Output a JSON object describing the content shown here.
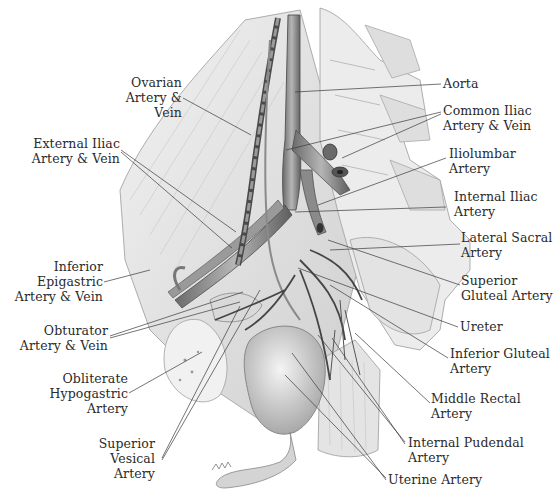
{
  "diagram": {
    "colors": {
      "ink": "#2a2a2a",
      "leader": "#3a3a3a",
      "tissue_light": "#e6e6e6",
      "tissue_mid": "#bdbdbd",
      "vessel_dark": "#555555"
    },
    "labels_left": [
      {
        "id": "ovarian",
        "lines": [
          "Ovarian",
          "Artery &",
          "Vein"
        ]
      },
      {
        "id": "external-iliac",
        "lines": [
          "External Iliac",
          "Artery & Vein"
        ]
      },
      {
        "id": "inferior-epigastric",
        "lines": [
          "Inferior",
          "Epigastric",
          "Artery & Vein"
        ]
      },
      {
        "id": "obturator",
        "lines": [
          "Obturator",
          "Artery & Vein"
        ]
      },
      {
        "id": "obliterate-hypogastric",
        "lines": [
          "Obliterate",
          "Hypogastric",
          "Artery"
        ]
      },
      {
        "id": "superior-vesical",
        "lines": [
          "Superior",
          "Vesical",
          "Artery"
        ]
      }
    ],
    "labels_right": [
      {
        "id": "aorta",
        "lines": [
          "Aorta"
        ]
      },
      {
        "id": "common-iliac",
        "lines": [
          "Common Iliac",
          "Artery & Vein"
        ]
      },
      {
        "id": "iliolumbar",
        "lines": [
          "Iliolumbar",
          "Artery"
        ]
      },
      {
        "id": "internal-iliac",
        "lines": [
          "Internal Iliac",
          "Artery"
        ]
      },
      {
        "id": "lateral-sacral",
        "lines": [
          "Lateral Sacral",
          "Artery"
        ]
      },
      {
        "id": "superior-gluteal",
        "lines": [
          "Superior",
          "Gluteal Artery"
        ]
      },
      {
        "id": "ureter",
        "lines": [
          "Ureter"
        ]
      },
      {
        "id": "inferior-gluteal",
        "lines": [
          "Inferior Gluteal",
          "Artery"
        ]
      },
      {
        "id": "middle-rectal",
        "lines": [
          "Middle Rectal",
          "Artery"
        ]
      },
      {
        "id": "internal-pudendal",
        "lines": [
          "Internal Pudendal",
          "Artery"
        ]
      },
      {
        "id": "uterine",
        "lines": [
          "Uterine Artery"
        ]
      }
    ]
  }
}
